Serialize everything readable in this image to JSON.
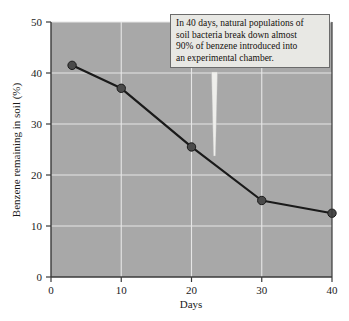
{
  "figure": {
    "background_color": "#ffffff",
    "plot_background_color": "#a8a8a8",
    "gridline_color": "#e6e6e6",
    "line_color": "#1a1a1a",
    "marker_color": "#4a4a4a",
    "axis_color": "#3a3a3a"
  },
  "annotation": {
    "text": "In 40 days, natural populations of soil bacteria break down almost 90% of benzene introduced into an experimental chamber.",
    "line1": "In 40 days, natural populations of",
    "line2": "soil bacteria break down almost",
    "line3": "90% of benzene introduced into",
    "line4": "an experimental chamber."
  },
  "axes": {
    "x_title": "Days",
    "y_title": "Benzene remaining in soil (%)",
    "x_ticks": [
      "0",
      "10",
      "20",
      "30",
      "40"
    ],
    "y_ticks": [
      "0",
      "10",
      "20",
      "30",
      "40",
      "50"
    ]
  },
  "chart_data": {
    "type": "line",
    "title": "",
    "subtitle": "",
    "xlabel": "Days",
    "ylabel": "Benzene remaining in soil (%)",
    "xlim": [
      0,
      40
    ],
    "ylim": [
      0,
      50
    ],
    "xticks": [
      0,
      10,
      20,
      30,
      40
    ],
    "yticks": [
      0,
      10,
      20,
      30,
      40,
      50
    ],
    "grid": true,
    "legend": "none",
    "annotations": [
      {
        "text": "In 40 days, natural populations of soil bacteria break down almost 90% of benzene introduced into an experimental chamber.",
        "points_to_x": 23,
        "points_to_y": 24
      }
    ],
    "series": [
      {
        "name": "Benzene remaining in soil",
        "x": [
          3,
          10,
          20,
          30,
          40
        ],
        "values": [
          41.5,
          37,
          25.5,
          15,
          12.5
        ]
      }
    ],
    "points": [
      {
        "x": 3,
        "y": 41.5
      },
      {
        "x": 10,
        "y": 37
      },
      {
        "x": 20,
        "y": 25.5
      },
      {
        "x": 30,
        "y": 15
      },
      {
        "x": 40,
        "y": 12.5
      }
    ]
  }
}
